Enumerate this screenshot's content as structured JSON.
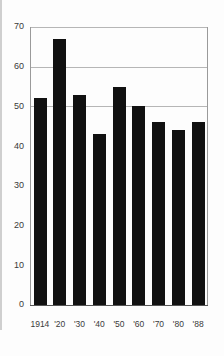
{
  "chart_data": {
    "type": "bar",
    "title": "",
    "subtitle": "",
    "xlabel": "",
    "ylabel": "",
    "categories": [
      "1914",
      "'20",
      "'30",
      "'40",
      "'50",
      "'60",
      "'70",
      "'80",
      "'88"
    ],
    "values": [
      52,
      67,
      53,
      43,
      55,
      50,
      46,
      44,
      46
    ],
    "ylim": [
      0,
      70
    ],
    "yticks": [
      0,
      10,
      20,
      30,
      40,
      50,
      60,
      70
    ],
    "ytick_labels": [
      "0",
      "10",
      "20",
      "30",
      "40",
      "50",
      "60",
      "70"
    ],
    "grid": "horizontal-partial",
    "gridline_values": [
      50,
      60,
      70
    ],
    "legend": null,
    "legend_position": "none",
    "bar_color": "#111111",
    "gridline_color": "#b6b6b6",
    "border_color": "#9a9a9a",
    "background_color": "#fdfdfd",
    "tick_label_color": "#3a3a3a",
    "series": [
      {
        "name": "value",
        "values": [
          52,
          67,
          53,
          43,
          55,
          50,
          46,
          44,
          46
        ]
      }
    ],
    "annotations": []
  },
  "figure": {
    "plot_area": {
      "left": 30,
      "right": 208,
      "top": 27,
      "bottom": 305
    }
  }
}
